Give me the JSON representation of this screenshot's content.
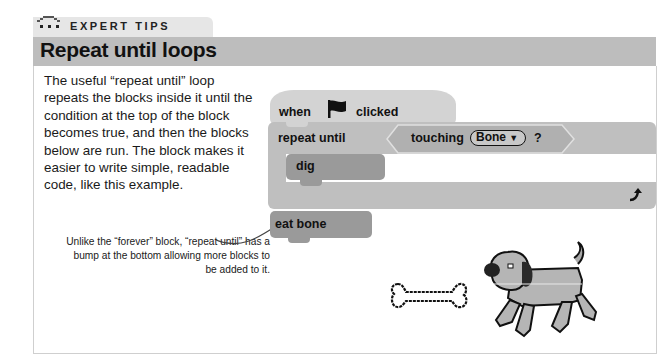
{
  "header": {
    "section_label": "EXPERT TIPS",
    "title": "Repeat until loops",
    "icon": "scratch-cat-paws-icon"
  },
  "body": {
    "paragraph": "The useful “repeat until” loop repeats the blocks inside it until the condition at the top of the block becomes true, and then the blocks below are run. The block makes it easier to write simple, readable code, like this example."
  },
  "annotation": {
    "text": "Unlike the “forever” block, “repeat until” has a bump at the bottom allowing more blocks to be added to it."
  },
  "script": {
    "hat": {
      "when": "when",
      "flag_icon": "green-flag-icon",
      "clicked": "clicked"
    },
    "repeat_until": {
      "label": "repeat until",
      "condition": {
        "label": "touching",
        "dropdown_value": "Bone",
        "suffix": "?"
      },
      "loop_icon": "loop-arrow-icon"
    },
    "inner_block": {
      "label": "dig"
    },
    "after_block": {
      "label": "eat bone"
    }
  },
  "sprites": [
    {
      "name": "bone"
    },
    {
      "name": "dog"
    }
  ],
  "colors": {
    "title_bar": "#bdbdbd",
    "tab": "#e6e6e6",
    "hat_block": "#d3d3d3",
    "control_block": "#bfbfbf",
    "custom_block": "#9a9a9a"
  }
}
